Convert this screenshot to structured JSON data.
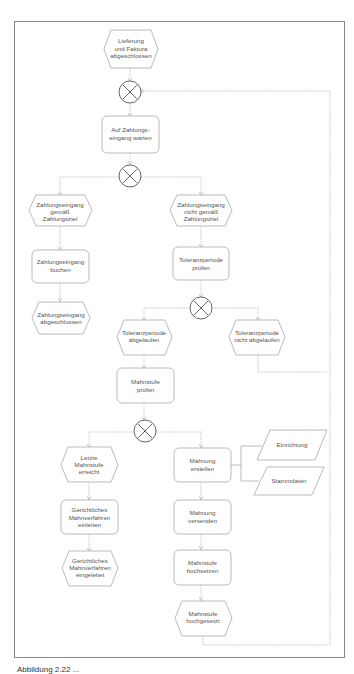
{
  "diagram": {
    "type": "EPK process flow (event-driven process chain)",
    "colors": {
      "frame": "#888888",
      "shape_stroke": "#aaaaaa",
      "connector": "#bbbbbb",
      "text": "#555555",
      "operator": "#555555"
    },
    "nodes": {
      "e1": {
        "type": "event",
        "lines": [
          "Lieferung",
          "und Faktura",
          "abgeschlossen"
        ]
      },
      "x1": {
        "type": "xor",
        "label": "XOR"
      },
      "f1": {
        "type": "function",
        "lines": [
          "Auf Zahlungs-",
          "eingang warten"
        ]
      },
      "x2": {
        "type": "xor",
        "label": "XOR"
      },
      "e2": {
        "type": "event",
        "lines": [
          "Zahlungseingang",
          "gemäß",
          "Zahlungsziel"
        ]
      },
      "f2": {
        "type": "function",
        "lines": [
          "Zahlungseingang",
          "buchen"
        ]
      },
      "e3": {
        "type": "event",
        "lines": [
          "Zahlungseingang",
          "abgeschlossen"
        ]
      },
      "e4": {
        "type": "event",
        "lines": [
          "Zahlungseingang",
          "nicht gemäß",
          "Zahlungsziel"
        ]
      },
      "f3": {
        "type": "function",
        "lines": [
          "Toleranzperiode",
          "prüfen"
        ]
      },
      "x3": {
        "type": "xor",
        "label": "XOR"
      },
      "e5": {
        "type": "event",
        "lines": [
          "Toleranzperiode",
          "abgelaufen"
        ]
      },
      "e6": {
        "type": "event",
        "lines": [
          "Toleranzperiode",
          "nicht abgelaufen"
        ]
      },
      "f4": {
        "type": "function",
        "lines": [
          "Mahnstufe",
          "prüfen"
        ]
      },
      "x4": {
        "type": "xor",
        "label": "XOR"
      },
      "e7": {
        "type": "event",
        "lines": [
          "Letzte",
          "Mahnstufe",
          "erreicht"
        ]
      },
      "f5": {
        "type": "function",
        "lines": [
          "Gerichtliches",
          "Mahnverfahren",
          "einleiten"
        ]
      },
      "e8": {
        "type": "event",
        "lines": [
          "Gerichtliches",
          "Mahnverfahren",
          "eingeleitet"
        ]
      },
      "f6": {
        "type": "function",
        "lines": [
          "Mahnung",
          "erstellen"
        ]
      },
      "d1": {
        "type": "data",
        "lines": [
          "Einrichtung"
        ]
      },
      "d2": {
        "type": "data",
        "lines": [
          "Stammdaten"
        ]
      },
      "f7": {
        "type": "function",
        "lines": [
          "Mahnung",
          "versenden"
        ]
      },
      "f8": {
        "type": "function",
        "lines": [
          "Mahnstufe",
          "hochsetzen"
        ]
      },
      "e9": {
        "type": "event",
        "lines": [
          "Mahnstufe",
          "hochgesetzt"
        ]
      }
    }
  },
  "caption": "Abbildung 2.22 ..."
}
